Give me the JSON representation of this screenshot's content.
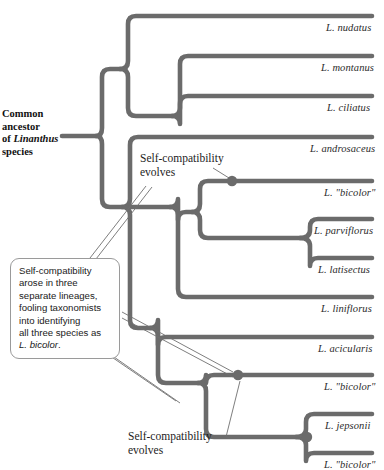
{
  "figure": {
    "type": "phylogenetic-tree"
  },
  "root": {
    "label_line1": "Common",
    "label_line2": "ancestor",
    "label_line3_prefix": "of ",
    "label_line3_italic": "Linanthus",
    "label_line4": "species",
    "label_full": "Common ancestor of Linanthus species"
  },
  "tips": [
    {
      "id": "nudatus",
      "label": "L. nudatus",
      "y": 16
    },
    {
      "id": "montanus",
      "label": "L. montanus",
      "y": 56
    },
    {
      "id": "ciliatus",
      "label": "L. ciliatus",
      "y": 96
    },
    {
      "id": "androsaceus",
      "label": "L. androsaceus",
      "y": 137
    },
    {
      "id": "bicolor-1",
      "label": "L. \"bicolor\"",
      "y": 180
    },
    {
      "id": "parviflorus",
      "label": "L. parviflorus",
      "y": 219
    },
    {
      "id": "latisectus",
      "label": "L. latisectus",
      "y": 258
    },
    {
      "id": "liniflorus",
      "label": "L. liniflorus",
      "y": 297
    },
    {
      "id": "acicularis",
      "label": "L. acicularis",
      "y": 337
    },
    {
      "id": "bicolor-2",
      "label": "L. \"bicolor\"",
      "y": 375
    },
    {
      "id": "jepsonii",
      "label": "L. jepsonii",
      "y": 414
    },
    {
      "id": "bicolor-3",
      "label": "L. \"bicolor\"",
      "y": 453
    }
  ],
  "annotations": {
    "top_event_line1": "Self-compatibility",
    "top_event_line2": "evolves",
    "bottom_event_line1": "Self-compatibility",
    "bottom_event_line2": "evolves"
  },
  "callout": {
    "line1": "Self-compatibility",
    "line2": "arose in three",
    "line3": "separate lineages,",
    "line4": "fooling taxonomists",
    "line5": "into identifying",
    "line6": "all three species as",
    "line7_italic": "L. bicolor",
    "line7_suffix": ".",
    "text_full": "Self-compatibility arose in three separate lineages, fooling taxonomists into identifying all three species as L. bicolor."
  },
  "event_nodes": [
    {
      "id": "event-node-1",
      "x": 232,
      "y": 181
    },
    {
      "id": "event-node-2",
      "x": 238,
      "y": 375
    },
    {
      "id": "event-node-3",
      "x": 307,
      "y": 437
    }
  ],
  "colors": {
    "branch": "#6b6b6b",
    "node_dot": "#6b6b6b",
    "text": "#2b2b2b",
    "callout_border": "#9a9a9a",
    "leader_line": "#6f6f6f",
    "background": "#ffffff"
  }
}
